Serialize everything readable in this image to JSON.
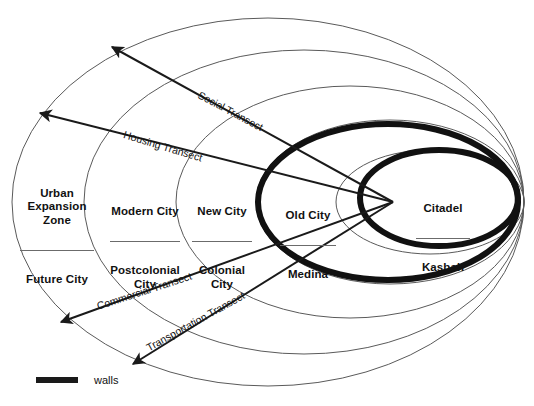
{
  "diagram": {
    "type": "concentric-zone-diagram"
  },
  "zones": [
    {
      "id": "urban-expansion-zone",
      "primary": "Urban\nExpansion\nZone",
      "secondary": "Future City",
      "x": 14,
      "y": 168,
      "width": 86,
      "rule_width": 74
    },
    {
      "id": "modern-city",
      "primary": "Modern City",
      "secondary": "Postcolonial\nCity",
      "x": 96,
      "y": 186,
      "width": 98,
      "rule_width": 70
    },
    {
      "id": "new-city",
      "primary": "New City",
      "secondary": "Colonial\nCity",
      "x": 186,
      "y": 186,
      "width": 72,
      "rule_width": 60
    },
    {
      "id": "old-city",
      "primary": "Old City",
      "secondary": "Medina",
      "x": 272,
      "y": 190,
      "width": 72,
      "rule_width": 56
    },
    {
      "id": "citadel",
      "primary": "Citadel",
      "secondary": "Kasbah",
      "x": 408,
      "y": 183,
      "width": 70,
      "rule_width": 54
    }
  ],
  "transects": [
    {
      "id": "social-transect",
      "label": "Social Transect",
      "label_x": 199,
      "label_y": 88,
      "rotation": 28,
      "arrow_x": 110,
      "arrow_y": 45
    },
    {
      "id": "housing-transect",
      "label": "Housing Transect",
      "label_x": 124,
      "label_y": 128,
      "rotation": 17,
      "arrow_x": 37,
      "arrow_y": 112
    },
    {
      "id": "commercial-transect",
      "label": "Commercial Transect",
      "label_x": 97,
      "label_y": 300,
      "rotation": -18,
      "arrow_x": 58,
      "arrow_y": 323
    },
    {
      "id": "transportation-transect",
      "label": "Transportation Transect",
      "label_x": 147,
      "label_y": 342,
      "rotation": -29,
      "arrow_x": 130,
      "arrow_y": 366
    }
  ],
  "convergence_point": {
    "x": 393,
    "y": 202
  },
  "legend": {
    "swatch_label": "walls",
    "swatch_color": "#1a1a1a"
  },
  "colors": {
    "thin_line": "#5a5a5a",
    "bold_wall": "#111111",
    "transect_line": "#1a1a1a",
    "text": "#111111",
    "background": "#ffffff",
    "rule": "#6b6b6b"
  },
  "ellipses": {
    "thin": [
      {
        "id": "outer-ellipse-urban-expansion",
        "cx": 268,
        "cy": 202,
        "rx": 256,
        "ry": 184
      },
      {
        "id": "ellipse-modern-city",
        "cx": 304,
        "cy": 202,
        "rx": 220,
        "ry": 152
      },
      {
        "id": "ellipse-new-city",
        "cx": 350,
        "cy": 202,
        "rx": 174,
        "ry": 116
      },
      {
        "id": "ellipse-old-city-thin",
        "cx": 390,
        "cy": 202,
        "rx": 134,
        "ry": 82
      },
      {
        "id": "ellipse-citadel-thin",
        "cx": 430,
        "cy": 202,
        "rx": 94,
        "ry": 52
      }
    ],
    "bold": [
      {
        "id": "wall-old-city",
        "cx": 388,
        "cy": 202,
        "rx": 130,
        "ry": 78,
        "stroke": 6
      },
      {
        "id": "wall-citadel",
        "cx": 439,
        "cy": 198,
        "rx": 79,
        "ry": 48,
        "stroke": 6
      }
    ]
  }
}
